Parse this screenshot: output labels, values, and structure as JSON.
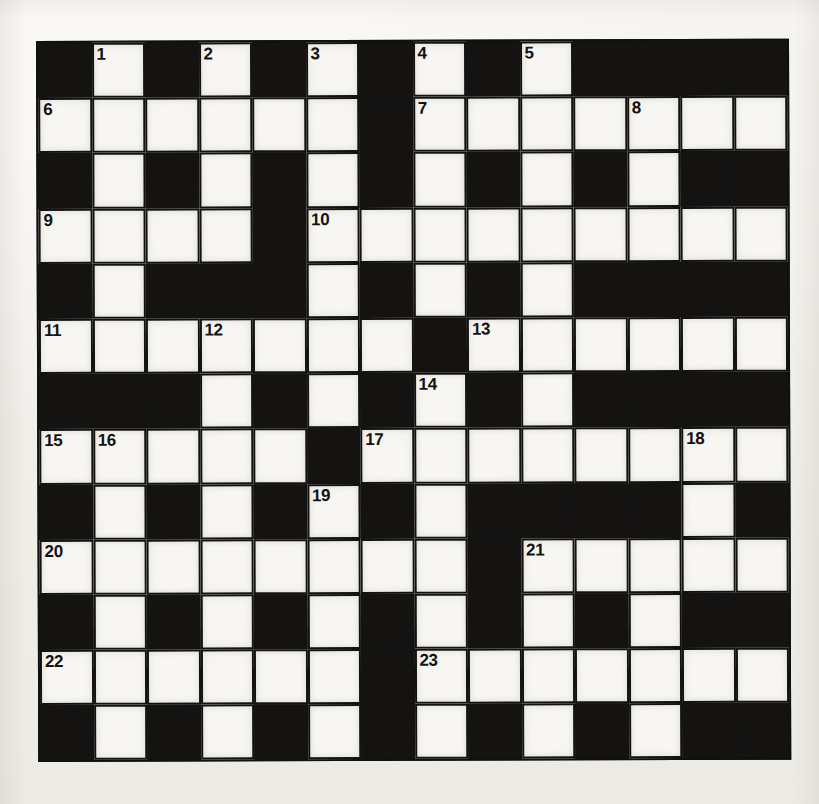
{
  "puzzle": {
    "type": "crossword-grid",
    "columns": 14,
    "rows": 13,
    "colors": {
      "block": "#141312",
      "light": "#f7f6f2",
      "paper": "#f2f1ed",
      "number": "#141312"
    },
    "legend": {
      "1": "white-open-cell",
      "0": "black-blocked-cell"
    },
    "cells": [
      [
        0,
        1,
        0,
        1,
        0,
        1,
        0,
        1,
        0,
        1,
        0,
        0,
        0,
        0
      ],
      [
        1,
        1,
        1,
        1,
        1,
        1,
        0,
        1,
        1,
        1,
        1,
        1,
        1,
        1
      ],
      [
        0,
        1,
        0,
        1,
        0,
        1,
        0,
        1,
        0,
        1,
        0,
        1,
        0,
        0
      ],
      [
        1,
        1,
        1,
        1,
        0,
        1,
        1,
        1,
        1,
        1,
        1,
        1,
        1,
        1
      ],
      [
        0,
        1,
        0,
        0,
        0,
        1,
        0,
        1,
        0,
        1,
        0,
        0,
        0,
        0
      ],
      [
        1,
        1,
        1,
        1,
        1,
        1,
        1,
        0,
        1,
        1,
        1,
        1,
        1,
        1
      ],
      [
        0,
        0,
        0,
        1,
        0,
        1,
        0,
        1,
        0,
        1,
        0,
        0,
        0,
        0
      ],
      [
        1,
        1,
        1,
        1,
        1,
        0,
        1,
        1,
        1,
        1,
        1,
        1,
        1,
        1
      ],
      [
        0,
        1,
        0,
        1,
        0,
        1,
        0,
        1,
        0,
        0,
        0,
        0,
        1,
        0
      ],
      [
        1,
        1,
        1,
        1,
        1,
        1,
        1,
        1,
        0,
        1,
        1,
        1,
        1,
        1
      ],
      [
        0,
        1,
        0,
        1,
        0,
        1,
        0,
        1,
        0,
        1,
        0,
        1,
        0,
        0
      ],
      [
        1,
        1,
        1,
        1,
        1,
        1,
        0,
        1,
        1,
        1,
        1,
        1,
        1,
        1
      ],
      [
        0,
        1,
        0,
        1,
        0,
        1,
        0,
        1,
        0,
        1,
        0,
        1,
        0,
        0
      ]
    ],
    "numbers": [
      {
        "n": "1",
        "row": 0,
        "col": 1
      },
      {
        "n": "2",
        "row": 0,
        "col": 3
      },
      {
        "n": "3",
        "row": 0,
        "col": 5
      },
      {
        "n": "4",
        "row": 0,
        "col": 7
      },
      {
        "n": "5",
        "row": 0,
        "col": 9
      },
      {
        "n": "6",
        "row": 1,
        "col": 0
      },
      {
        "n": "7",
        "row": 1,
        "col": 7
      },
      {
        "n": "8",
        "row": 1,
        "col": 11
      },
      {
        "n": "9",
        "row": 3,
        "col": 0
      },
      {
        "n": "10",
        "row": 3,
        "col": 5
      },
      {
        "n": "11",
        "row": 5,
        "col": 0
      },
      {
        "n": "12",
        "row": 5,
        "col": 3
      },
      {
        "n": "13",
        "row": 5,
        "col": 8
      },
      {
        "n": "14",
        "row": 6,
        "col": 7
      },
      {
        "n": "15",
        "row": 7,
        "col": 0
      },
      {
        "n": "16",
        "row": 7,
        "col": 1
      },
      {
        "n": "17",
        "row": 7,
        "col": 6
      },
      {
        "n": "18",
        "row": 7,
        "col": 12
      },
      {
        "n": "19",
        "row": 8,
        "col": 5
      },
      {
        "n": "20",
        "row": 9,
        "col": 0
      },
      {
        "n": "21",
        "row": 9,
        "col": 9
      },
      {
        "n": "22",
        "row": 11,
        "col": 0
      },
      {
        "n": "23",
        "row": 11,
        "col": 7
      }
    ]
  }
}
